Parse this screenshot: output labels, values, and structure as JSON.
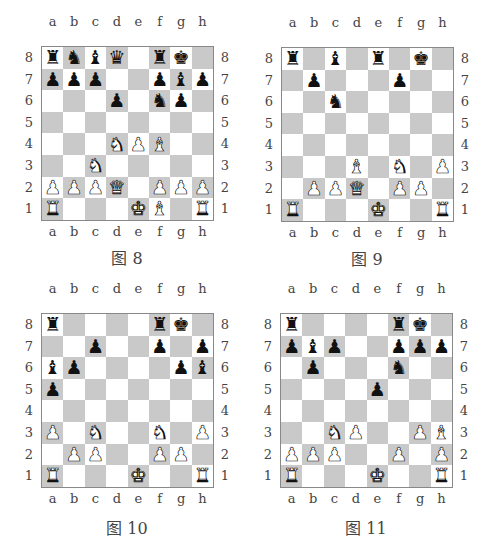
{
  "files": [
    "a",
    "b",
    "c",
    "d",
    "e",
    "f",
    "g",
    "h"
  ],
  "ranks": [
    "8",
    "7",
    "6",
    "5",
    "4",
    "3",
    "2",
    "1"
  ],
  "diagrams": [
    {
      "caption": "图 8",
      "pieces": {
        "a8": "bR",
        "b8": "bN",
        "c8": "bB",
        "d8": "bQ",
        "f8": "bR",
        "g8": "bK",
        "a7": "bP",
        "b7": "bP",
        "c7": "bP",
        "f7": "bP",
        "g7": "bB",
        "h7": "bP",
        "d6": "bP",
        "f6": "bN",
        "g6": "bP",
        "d4": "wN",
        "e4": "wP",
        "f4": "wB",
        "c3": "wN",
        "a2": "wP",
        "b2": "wP",
        "c2": "wP",
        "d2": "wQ",
        "f2": "wP",
        "g2": "wP",
        "h2": "wP",
        "a1": "wR",
        "e1": "wK",
        "f1": "wB",
        "h1": "wR"
      }
    },
    {
      "caption": "图 9",
      "pieces": {
        "a8": "bR",
        "c8": "bB",
        "e8": "bR",
        "g8": "bK",
        "b7": "bP",
        "f7": "bP",
        "c6": "bN",
        "d3": "wB",
        "f3": "wN",
        "h3": "wP",
        "b2": "wP",
        "c2": "wP",
        "d2": "wQ",
        "f2": "wP",
        "g2": "wP",
        "a1": "wR",
        "e1": "wK",
        "h1": "wR"
      }
    },
    {
      "caption": "图 10",
      "pieces": {
        "a8": "bR",
        "f8": "bR",
        "g8": "bK",
        "c7": "bP",
        "f7": "bP",
        "h7": "bP",
        "a6": "bB",
        "b6": "bP",
        "g6": "bP",
        "h6": "bB",
        "a5": "bP",
        "a3": "wP",
        "c3": "wN",
        "f3": "wN",
        "h3": "wP",
        "b2": "wP",
        "c2": "wP",
        "f2": "wP",
        "g2": "wP",
        "a1": "wR",
        "e1": "wK",
        "h1": "wR"
      }
    },
    {
      "caption": "图 11",
      "pieces": {
        "a8": "bR",
        "f8": "bR",
        "g8": "bK",
        "a7": "bP",
        "b7": "bB",
        "c7": "bP",
        "f7": "bP",
        "g7": "bP",
        "h7": "bP",
        "b6": "bP",
        "f6": "bN",
        "e5": "bP",
        "c3": "wN",
        "d3": "wP",
        "g3": "wP",
        "h3": "wB",
        "a2": "wP",
        "b2": "wP",
        "c2": "wP",
        "f2": "wP",
        "h2": "wP",
        "a1": "wR",
        "e1": "wK",
        "h1": "wR"
      }
    }
  ],
  "glyphs": {
    "K": "♚",
    "Q": "♛",
    "R": "♜",
    "B": "♝",
    "N": "♞",
    "P": "♟"
  },
  "piece_names": {
    "K": "king",
    "Q": "queen",
    "R": "rook",
    "B": "bishop",
    "N": "knight",
    "P": "pawn"
  },
  "colors": {
    "light_square": "#ffffff",
    "dark_square": "#c9c9c9"
  }
}
